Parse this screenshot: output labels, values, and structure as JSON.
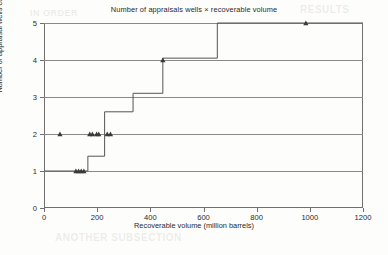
{
  "figure": {
    "title": "Number of appraisals wells × recoverable volume",
    "xlabel": "Recoverable volume (million barrels)",
    "ylabel": "Number of appraisal wells count"
  },
  "ghost_text": [
    {
      "text": "RESULTS",
      "x": 300,
      "y": 4,
      "size": 10
    },
    {
      "text": "IN ORDER",
      "x": 30,
      "y": 8,
      "size": 9
    },
    {
      "text": "ANOTHER SUBSECTION",
      "x": 55,
      "y": 232,
      "size": 10
    }
  ],
  "chart_data": {
    "type": "line",
    "title": "Number of appraisals wells × recoverable volume",
    "xlabel": "Recoverable volume (million barrels)",
    "ylabel": "Number of appraisal wells count",
    "xlim": [
      0,
      1200
    ],
    "ylim": [
      0,
      5
    ],
    "xticks": [
      0,
      200,
      400,
      600,
      800,
      1000,
      1200
    ],
    "yticks": [
      0,
      1,
      2,
      3,
      4,
      5
    ],
    "grid": "horizontal",
    "legend": "none",
    "series": [
      {
        "name": "step-curve",
        "style": "step",
        "points": [
          {
            "x": 0,
            "y": 1.0
          },
          {
            "x": 165,
            "y": 1.0
          },
          {
            "x": 165,
            "y": 1.4
          },
          {
            "x": 228,
            "y": 1.4
          },
          {
            "x": 228,
            "y": 2.6
          },
          {
            "x": 335,
            "y": 2.6
          },
          {
            "x": 335,
            "y": 3.1
          },
          {
            "x": 447,
            "y": 3.1
          },
          {
            "x": 447,
            "y": 4.05
          },
          {
            "x": 652,
            "y": 4.05
          },
          {
            "x": 652,
            "y": 5.0
          },
          {
            "x": 1200,
            "y": 5.0
          }
        ]
      },
      {
        "name": "appraisal-well-observations",
        "style": "markers",
        "marker": "triangle",
        "points": [
          {
            "x": 60,
            "y": 2
          },
          {
            "x": 120,
            "y": 1
          },
          {
            "x": 130,
            "y": 1
          },
          {
            "x": 140,
            "y": 1
          },
          {
            "x": 150,
            "y": 1
          },
          {
            "x": 172,
            "y": 2
          },
          {
            "x": 182,
            "y": 2
          },
          {
            "x": 198,
            "y": 2
          },
          {
            "x": 206,
            "y": 2
          },
          {
            "x": 238,
            "y": 2
          },
          {
            "x": 250,
            "y": 2
          },
          {
            "x": 447,
            "y": 4
          },
          {
            "x": 985,
            "y": 5
          }
        ]
      }
    ]
  }
}
